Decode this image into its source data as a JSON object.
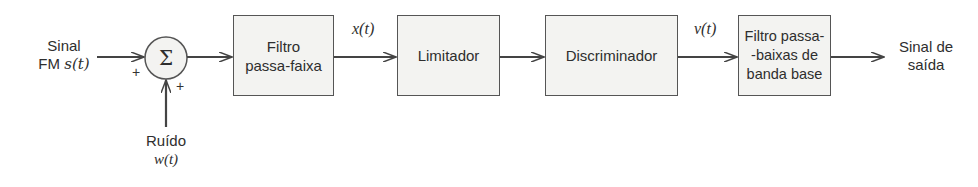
{
  "diagram": {
    "type": "block-diagram",
    "title": "",
    "input": {
      "line1": "Sinal",
      "line2_text": "FM ",
      "line2_math": "s(t)"
    },
    "noise": {
      "line1": "Ruído",
      "line2_math": "w(t)"
    },
    "summer": {
      "symbol": "Σ",
      "sign_left": "+",
      "sign_bottom": "+"
    },
    "blocks": [
      {
        "id": "bpf",
        "line1": "Filtro",
        "line2": "passa-faixa"
      },
      {
        "id": "limiter",
        "line1": "Limitador"
      },
      {
        "id": "discriminator",
        "line1": "Discriminador"
      },
      {
        "id": "lpf",
        "line1": "Filtro passa-",
        "line2": "-baixas de",
        "line3": "banda base"
      }
    ],
    "signals": {
      "after_bpf": "x(t)",
      "after_discriminator": "v(t)"
    },
    "output": {
      "line1": "Sinal de",
      "line2": "saída"
    },
    "colors": {
      "block_fill": "#f3f3f1",
      "stroke": "#555555",
      "text": "#2e2e2e"
    }
  }
}
